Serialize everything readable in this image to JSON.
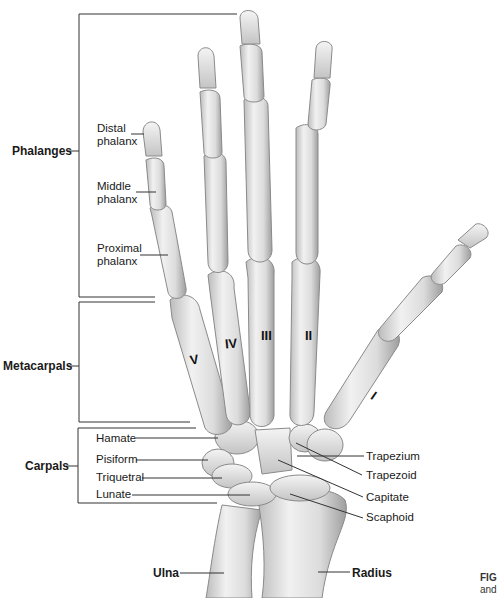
{
  "figure": {
    "groups": [
      {
        "label": "Phalanges",
        "x": 9,
        "y": 144
      },
      {
        "label": "Metacarpals",
        "x": 3,
        "y": 359
      },
      {
        "label": "Carpals",
        "x": 25,
        "y": 459
      }
    ],
    "phalanx_labels": [
      {
        "label": "Distal\nphalanx",
        "line1": "Distal",
        "line2": "phalanx"
      },
      {
        "label": "Middle\nphalanx",
        "line1": "Middle",
        "line2": "phalanx"
      },
      {
        "label": "Proximal\nphalanx",
        "line1": "Proximal",
        "line2": "phalanx"
      }
    ],
    "carpal_labels_left": [
      "Hamate",
      "Pisiform",
      "Triquetral",
      "Lunate"
    ],
    "carpal_labels_right": [
      "Trapezium",
      "Trapezoid",
      "Capitate",
      "Scaphoid"
    ],
    "forearm_labels": {
      "ulna": "Ulna",
      "radius": "Radius"
    },
    "metacarpal_numerals": [
      "V",
      "IV",
      "III",
      "II",
      "I"
    ],
    "caption_fragment": {
      "line1": "FIG",
      "line2": "and"
    },
    "colors": {
      "bone": "#e6e6e6",
      "bone_shade": "#b9b9b9",
      "outline": "#8a8a8a",
      "leader": "#333333"
    }
  }
}
